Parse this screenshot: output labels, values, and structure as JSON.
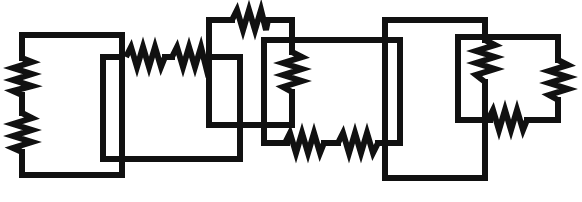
{
  "diagram": {
    "type": "resistor-circuit",
    "title": "",
    "wire_color": "#111111",
    "background": "#ffffff",
    "stroke_width": 6,
    "resistor_count": 12,
    "loops": [
      {
        "id": "loop-a",
        "rect": [
          22,
          35,
          122,
          175
        ],
        "resistors": [
          "r1",
          "r2"
        ]
      },
      {
        "id": "loop-b",
        "rect": [
          103,
          57,
          240,
          159
        ],
        "resistors": [
          "r3",
          "r4"
        ]
      },
      {
        "id": "loop-c",
        "rect": [
          209,
          20,
          292,
          125
        ],
        "resistors": [
          "r5",
          "r6"
        ]
      },
      {
        "id": "loop-d",
        "rect": [
          264,
          40,
          400,
          143
        ],
        "resistors": [
          "r7",
          "r8"
        ]
      },
      {
        "id": "loop-e",
        "rect": [
          385,
          20,
          485,
          178
        ],
        "resistors": [
          "r9"
        ]
      },
      {
        "id": "loop-f",
        "rect": [
          458,
          37,
          558,
          120
        ],
        "resistors": [
          "r10",
          "r11",
          "r12"
        ]
      }
    ],
    "resistors": [
      {
        "id": "r1",
        "orientation": "vertical",
        "x": 22,
        "y1": 58,
        "y2": 95
      },
      {
        "id": "r2",
        "orientation": "vertical",
        "x": 22,
        "y1": 113,
        "y2": 152
      },
      {
        "id": "r3",
        "orientation": "horizontal",
        "y": 57,
        "x1": 128,
        "x2": 165
      },
      {
        "id": "r4",
        "orientation": "horizontal",
        "y": 57,
        "x1": 172,
        "x2": 208
      },
      {
        "id": "r5",
        "orientation": "horizontal",
        "y": 20,
        "x1": 232,
        "x2": 268
      },
      {
        "id": "r6",
        "orientation": "vertical",
        "x": 292,
        "y1": 52,
        "y2": 92
      },
      {
        "id": "r7",
        "orientation": "horizontal",
        "y": 143,
        "x1": 287,
        "x2": 324
      },
      {
        "id": "r8",
        "orientation": "horizontal",
        "y": 143,
        "x1": 338,
        "x2": 378
      },
      {
        "id": "r9",
        "orientation": "vertical",
        "x": 485,
        "y1": 40,
        "y2": 82
      },
      {
        "id": "r10",
        "orientation": "vertical",
        "x": 558,
        "y1": 60,
        "y2": 100
      },
      {
        "id": "r11",
        "orientation": "horizontal",
        "y": 120,
        "x1": 490,
        "x2": 527
      }
    ]
  },
  "labels": {
    "caption": "Overlapping rectangular resistor network"
  }
}
